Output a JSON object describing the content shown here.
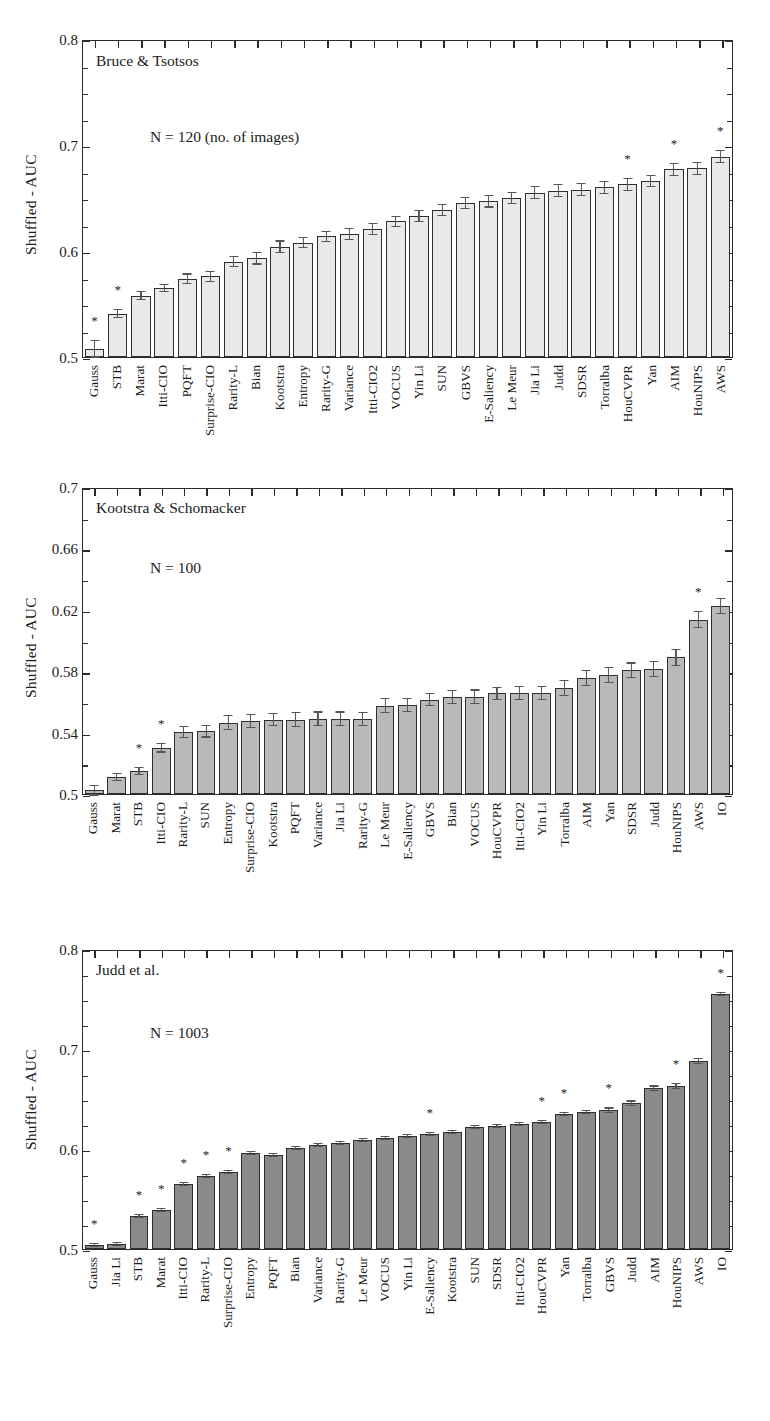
{
  "figure": {
    "ylabel": "Shuffled - AUC",
    "star_symbol": "*"
  },
  "chart_data": [
    {
      "type": "bar",
      "title": "Bruce & Tsotsos",
      "annotation": "N = 120 (no. of images)",
      "ylabel": "Shuffled - AUC",
      "xlabel": "",
      "ylim": [
        0.5,
        0.8
      ],
      "yticks": [
        0.5,
        0.6,
        0.7,
        0.8
      ],
      "yticklabels": [
        "0.5",
        "0.6",
        "0.7",
        "0.8"
      ],
      "yminor_step": 0.025,
      "grid": false,
      "bar_color": "#e9e9e9",
      "categories": [
        "Gauss",
        "STB",
        "Marat",
        "Itti-CIO",
        "PQFT",
        "Surprise-CIO",
        "Rarity-L",
        "Bian",
        "Kootstra",
        "Entropy",
        "Rarity-G",
        "Variance",
        "Itti-CIO2",
        "VOCUS",
        "Yin Li",
        "SUN",
        "GBVS",
        "E-Saliency",
        "Le Meur",
        "Jia Li",
        "Judd",
        "SDSR",
        "Torralba",
        "HouCVPR",
        "Yan",
        "AIM",
        "HouNIPS",
        "AWS"
      ],
      "values": [
        0.508,
        0.541,
        0.558,
        0.565,
        0.574,
        0.576,
        0.59,
        0.593,
        0.604,
        0.608,
        0.614,
        0.616,
        0.621,
        0.628,
        0.633,
        0.639,
        0.645,
        0.647,
        0.65,
        0.655,
        0.657,
        0.658,
        0.66,
        0.663,
        0.666,
        0.677,
        0.678,
        0.689
      ],
      "errors": [
        0.0085,
        0.0045,
        0.0042,
        0.004,
        0.0048,
        0.005,
        0.0052,
        0.0058,
        0.006,
        0.0055,
        0.0052,
        0.0058,
        0.0058,
        0.0055,
        0.0058,
        0.0058,
        0.0058,
        0.006,
        0.006,
        0.006,
        0.0062,
        0.0062,
        0.0062,
        0.0062,
        0.006,
        0.0062,
        0.006,
        0.006
      ],
      "significant": [
        "Gauss",
        "STB",
        "HouCVPR",
        "AIM",
        "AWS"
      ]
    },
    {
      "type": "bar",
      "title": "Kootstra & Schomacker",
      "annotation": "N = 100",
      "ylabel": "Shuffled - AUC",
      "xlabel": "",
      "ylim": [
        0.5,
        0.7
      ],
      "yticks": [
        0.5,
        0.54,
        0.58,
        0.62,
        0.66,
        0.7
      ],
      "yticklabels": [
        "0.5",
        "0.54",
        "0.58",
        "0.62",
        "0.66",
        "0.7"
      ],
      "yminor_step": 0.02,
      "grid": false,
      "bar_color": "#b9b9b9",
      "categories": [
        "Gauss",
        "Marat",
        "STB",
        "Itti-CIO",
        "Rarity-L",
        "SUN",
        "Entropy",
        "Surprise-CIO",
        "Kootstra",
        "PQFT",
        "Variance",
        "Jia Li",
        "Rarity-G",
        "Le Meur",
        "E-Saliency",
        "GBVS",
        "Bian",
        "VOCUS",
        "HouCVPR",
        "Itti-CIO2",
        "Yin Li",
        "Torralba",
        "AIM",
        "Yan",
        "SDSR",
        "Judd",
        "HouNIPS",
        "AWS",
        "IO"
      ],
      "values": [
        0.5025,
        0.511,
        0.515,
        0.53,
        0.5405,
        0.541,
        0.5465,
        0.5475,
        0.5485,
        0.5485,
        0.549,
        0.549,
        0.549,
        0.5575,
        0.558,
        0.5615,
        0.563,
        0.5635,
        0.5655,
        0.566,
        0.566,
        0.569,
        0.5755,
        0.5775,
        0.5805,
        0.5815,
        0.589,
        0.6135,
        0.6225
      ],
      "errors": [
        0.0035,
        0.0025,
        0.0026,
        0.003,
        0.004,
        0.0042,
        0.0048,
        0.0048,
        0.0042,
        0.005,
        0.0048,
        0.0048,
        0.0045,
        0.005,
        0.0048,
        0.0044,
        0.0045,
        0.0046,
        0.0045,
        0.0046,
        0.0045,
        0.0052,
        0.0052,
        0.0052,
        0.0052,
        0.0054,
        0.0058,
        0.0055,
        0.005
      ],
      "significant": [
        "STB",
        "Itti-CIO",
        "AWS"
      ]
    },
    {
      "type": "bar",
      "title": "Judd et al.",
      "annotation": "N = 1003",
      "ylabel": "Shuffled - AUC",
      "xlabel": "",
      "ylim": [
        0.5,
        0.8
      ],
      "yticks": [
        0.5,
        0.6,
        0.7,
        0.8
      ],
      "yticklabels": [
        "0.5",
        "0.6",
        "0.7",
        "0.8"
      ],
      "yminor_step": 0.025,
      "grid": false,
      "bar_color": "#8a8a8a",
      "categories": [
        "Gauss",
        "Jia Li",
        "STB",
        "Marat",
        "Itti-CIO",
        "Rarity-L",
        "Surprise-CIO",
        "Entropy",
        "PQFT",
        "Bian",
        "Variance",
        "Rarity-G",
        "Le Meur",
        "VOCUS",
        "Yin Li",
        "E-Saliency",
        "Kootstra",
        "SUN",
        "SDSR",
        "Itti-CIO2",
        "HouCVPR",
        "Yan",
        "Torralba",
        "GBVS",
        "Judd",
        "AIM",
        "HouNIPS",
        "AWS",
        "IO"
      ],
      "values": [
        0.504,
        0.505,
        0.533,
        0.539,
        0.565,
        0.573,
        0.577,
        0.596,
        0.594,
        0.601,
        0.604,
        0.606,
        0.609,
        0.611,
        0.613,
        0.615,
        0.617,
        0.622,
        0.623,
        0.625,
        0.627,
        0.635,
        0.637,
        0.639,
        0.646,
        0.661,
        0.663,
        0.688,
        0.755
      ],
      "errors": [
        0.0022,
        0.0022,
        0.002,
        0.002,
        0.002,
        0.0022,
        0.0022,
        0.0022,
        0.0022,
        0.0022,
        0.0022,
        0.0022,
        0.0022,
        0.0022,
        0.0022,
        0.0022,
        0.0022,
        0.0022,
        0.0024,
        0.0024,
        0.0024,
        0.0024,
        0.0024,
        0.0026,
        0.0026,
        0.0026,
        0.0028,
        0.003,
        0.0022
      ],
      "significant": [
        "Gauss",
        "STB",
        "Marat",
        "Itti-CIO",
        "Rarity-L",
        "Surprise-CIO",
        "E-Saliency",
        "HouCVPR",
        "Yan",
        "GBVS",
        "HouNIPS",
        "IO"
      ]
    }
  ]
}
